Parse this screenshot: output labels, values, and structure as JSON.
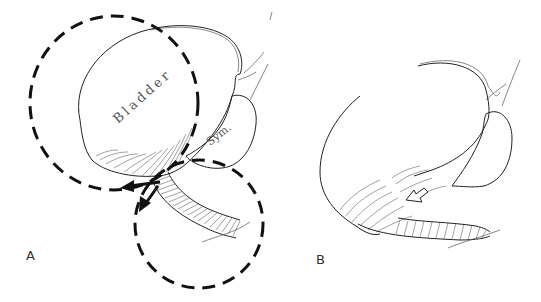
{
  "figure": {
    "panels": [
      {
        "id": "A",
        "label": "A",
        "annotations": {
          "bladder": "Bladder",
          "symphysis": "Sym."
        },
        "dashed_circles": 2,
        "arrows": [
          "solid-arrow-left",
          "solid-arrow-down"
        ]
      },
      {
        "id": "B",
        "label": "B",
        "arrows": [
          "hollow-arrow-down-left"
        ]
      }
    ],
    "colors": {
      "ink": "#222222",
      "background": "#ffffff"
    }
  }
}
